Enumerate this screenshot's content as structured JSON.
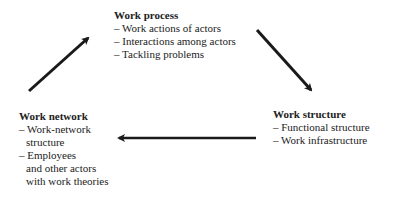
{
  "diagram": {
    "nodes": {
      "process": {
        "title": "Work process",
        "items": [
          "– Work actions of actors",
          "– Interactions among actors",
          "– Tackling problems"
        ]
      },
      "structure": {
        "title": "Work structure",
        "items": [
          "– Functional structure",
          "– Work infrastructure"
        ]
      },
      "network": {
        "title": "Work network",
        "items": [
          "– Work-network",
          "structure",
          "– Employees",
          "and other actors",
          "with work theories"
        ]
      }
    },
    "edges": [
      {
        "from": "network",
        "to": "process"
      },
      {
        "from": "process",
        "to": "structure"
      },
      {
        "from": "structure",
        "to": "network"
      }
    ],
    "arrow_color": "#1a1a1a"
  }
}
